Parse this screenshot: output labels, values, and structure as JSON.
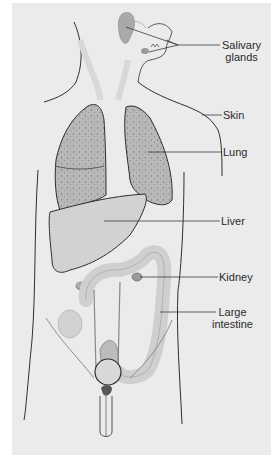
{
  "figure": {
    "title": "",
    "colors": {
      "background": "#ebebeb",
      "outline": "#2e2e2e",
      "organ_fill": "#d2d2d2",
      "lung_fill": "#b9b9b9",
      "leader_line": "#3a3a3a"
    },
    "labels": [
      {
        "id": "salivary-glands",
        "lines": [
          "Salivary",
          "glands"
        ]
      },
      {
        "id": "skin",
        "lines": [
          "Skin"
        ]
      },
      {
        "id": "lung",
        "lines": [
          "Lung"
        ]
      },
      {
        "id": "liver",
        "lines": [
          "Liver"
        ]
      },
      {
        "id": "kidney",
        "lines": [
          "Kidney"
        ]
      },
      {
        "id": "large-intestine",
        "lines": [
          "Large",
          "intestine"
        ]
      }
    ]
  }
}
